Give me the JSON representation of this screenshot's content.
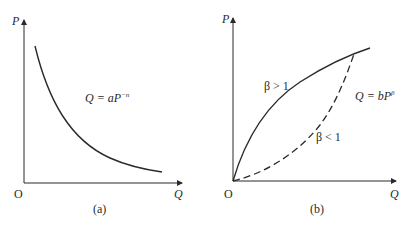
{
  "panels": [
    {
      "id": "a",
      "caption": "(a)",
      "axes": {
        "x_label": "Q",
        "y_label": "P",
        "origin_label": "O"
      },
      "curves": [
        {
          "name": "demand-curve",
          "style": "solid",
          "equation_base": "Q = aP",
          "equation_exponent": "−n"
        }
      ]
    },
    {
      "id": "b",
      "caption": "(b)",
      "axes": {
        "x_label": "Q",
        "y_label": "P",
        "origin_label": "O"
      },
      "equation_base": "Q = bP",
      "equation_exponent": "β",
      "curves": [
        {
          "name": "beta-greater-than-one",
          "style": "solid",
          "label": "β > 1"
        },
        {
          "name": "beta-less-than-one",
          "style": "dashed",
          "label": "β < 1"
        }
      ]
    }
  ],
  "colors": {
    "line": "#2a2a2a",
    "background": "#ffffff"
  }
}
